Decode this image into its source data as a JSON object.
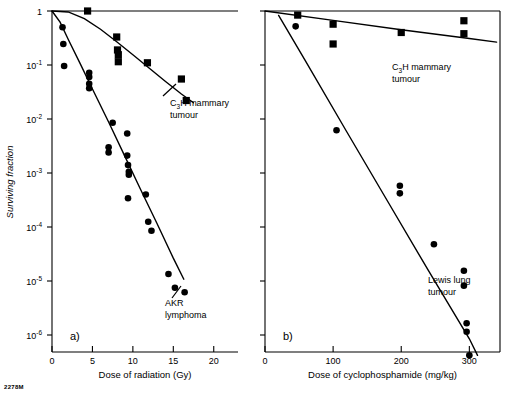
{
  "figure": {
    "mark": "2278M",
    "ylabel": "Surviving fraction",
    "y_ticks": [
      {
        "label": "1",
        "exp": "",
        "value": 0
      },
      {
        "label": "10",
        "exp": "-1",
        "value": -1
      },
      {
        "label": "10",
        "exp": "-2",
        "value": -2
      },
      {
        "label": "10",
        "exp": "-3",
        "value": -3
      },
      {
        "label": "10",
        "exp": "-4",
        "value": -4
      },
      {
        "label": "10",
        "exp": "-5",
        "value": -5
      },
      {
        "label": "10",
        "exp": "-6",
        "value": -6
      }
    ]
  },
  "panel_a": {
    "id": "a)",
    "xlabel": "Dose of radiation (Gy)",
    "x_ticks": [
      "0",
      "5",
      "10",
      "15",
      "20"
    ],
    "annotations": [
      {
        "name": "c3h-mammary-tumour",
        "line1": "C",
        "sub": "3",
        "line1b": "H mammary",
        "line2": "tumour"
      },
      {
        "name": "akr-lymphoma",
        "line1": "AKR",
        "line2": "lymphoma"
      }
    ]
  },
  "panel_b": {
    "id": "b)",
    "xlabel": "Dose of cyclophosphamide (mg/kg)",
    "x_ticks": [
      "0",
      "100",
      "200",
      "300"
    ],
    "annotations": [
      {
        "name": "c3h-mammary-tumour",
        "line1": "C",
        "sub": "3",
        "line1b": "H mammary",
        "line2": "tumour"
      },
      {
        "name": "lewis-lung-tumour",
        "line1": "Lewis lung",
        "line2": "tumour"
      }
    ]
  },
  "chart_data": {
    "type": "scatter",
    "title": "",
    "panels": [
      {
        "id": "a",
        "xlabel": "Dose of radiation (Gy)",
        "ylabel": "Surviving fraction",
        "xlim": [
          0,
          23
        ],
        "ylim_log10": [
          -6.4,
          0.1
        ],
        "xticks": [
          0,
          5,
          10,
          15,
          20
        ],
        "yticks_log10": [
          0,
          -1,
          -2,
          -3,
          -4,
          -5,
          -6
        ],
        "grid": false,
        "legend": "none",
        "series": [
          {
            "name": "C3H mammary tumour",
            "marker": "square",
            "points": [
              {
                "x": 4.4,
                "y": 1.0
              },
              {
                "x": 8.0,
                "y": 0.33
              },
              {
                "x": 8.1,
                "y": 0.19
              },
              {
                "x": 8.2,
                "y": 0.155
              },
              {
                "x": 8.2,
                "y": 0.115
              },
              {
                "x": 11.8,
                "y": 0.11
              },
              {
                "x": 16.0,
                "y": 0.055
              },
              {
                "x": 16.6,
                "y": 0.022
              }
            ],
            "fit_curve": [
              {
                "x": 0.0,
                "y": 1.0
              },
              {
                "x": 2.0,
                "y": 0.96
              },
              {
                "x": 4.0,
                "y": 0.72
              },
              {
                "x": 6.0,
                "y": 0.46
              },
              {
                "x": 8.0,
                "y": 0.27
              },
              {
                "x": 10.0,
                "y": 0.155
              },
              {
                "x": 12.0,
                "y": 0.088
              },
              {
                "x": 14.0,
                "y": 0.05
              },
              {
                "x": 16.0,
                "y": 0.029
              },
              {
                "x": 17.5,
                "y": 0.02
              }
            ]
          },
          {
            "name": "AKR lymphoma",
            "marker": "circle",
            "points": [
              {
                "x": 1.3,
                "y": 0.5
              },
              {
                "x": 1.4,
                "y": 0.245
              },
              {
                "x": 1.5,
                "y": 0.096
              },
              {
                "x": 4.6,
                "y": 0.072
              },
              {
                "x": 4.6,
                "y": 0.06
              },
              {
                "x": 4.6,
                "y": 0.045
              },
              {
                "x": 4.6,
                "y": 0.037
              },
              {
                "x": 7.5,
                "y": 0.0085
              },
              {
                "x": 7.0,
                "y": 0.003
              },
              {
                "x": 7.0,
                "y": 0.0024
              },
              {
                "x": 9.3,
                "y": 0.0054
              },
              {
                "x": 9.3,
                "y": 0.0021
              },
              {
                "x": 9.4,
                "y": 0.0014
              },
              {
                "x": 9.5,
                "y": 0.00105
              },
              {
                "x": 9.5,
                "y": 0.00093
              },
              {
                "x": 9.4,
                "y": 0.00034
              },
              {
                "x": 11.6,
                "y": 0.0004
              },
              {
                "x": 11.9,
                "y": 0.000125
              },
              {
                "x": 12.3,
                "y": 8.5e-05
              },
              {
                "x": 14.4,
                "y": 1.35e-05
              },
              {
                "x": 15.2,
                "y": 7.5e-06
              },
              {
                "x": 16.4,
                "y": 6.2e-06
              }
            ],
            "fit_curve": [
              {
                "x": 0.0,
                "y": 1.0
              },
              {
                "x": 1.0,
                "y": 0.62
              },
              {
                "x": 2.0,
                "y": 0.3
              },
              {
                "x": 3.5,
                "y": 0.105
              },
              {
                "x": 5.0,
                "y": 0.036
              },
              {
                "x": 7.0,
                "y": 0.0088
              },
              {
                "x": 9.0,
                "y": 0.00205
              },
              {
                "x": 11.0,
                "y": 0.00048
              },
              {
                "x": 13.0,
                "y": 0.000115
              },
              {
                "x": 15.0,
                "y": 2.65e-05
              },
              {
                "x": 16.3,
                "y": 1.08e-05
              }
            ]
          }
        ]
      },
      {
        "id": "b",
        "xlabel": "Dose of cyclophosphamide (mg/kg)",
        "ylabel": "Surviving fraction",
        "xlim": [
          0,
          345
        ],
        "ylim_log10": [
          -6.4,
          0.1
        ],
        "xticks": [
          0,
          100,
          200,
          300
        ],
        "yticks_log10": [
          0,
          -1,
          -2,
          -3,
          -4,
          -5,
          -6
        ],
        "grid": false,
        "legend": "none",
        "series": [
          {
            "name": "C3H mammary tumour",
            "marker": "square",
            "points": [
              {
                "x": 48,
                "y": 0.84
              },
              {
                "x": 100,
                "y": 0.57
              },
              {
                "x": 100,
                "y": 0.245
              },
              {
                "x": 200,
                "y": 0.4
              },
              {
                "x": 292,
                "y": 0.66
              },
              {
                "x": 292,
                "y": 0.38
              }
            ],
            "fit_curve": [
              {
                "x": 0,
                "y": 1.0
              },
              {
                "x": 100,
                "y": 0.67
              },
              {
                "x": 200,
                "y": 0.45
              },
              {
                "x": 300,
                "y": 0.31
              },
              {
                "x": 340,
                "y": 0.265
              }
            ]
          },
          {
            "name": "Lewis lung tumour",
            "marker": "circle",
            "points": [
              {
                "x": 45,
                "y": 0.52
              },
              {
                "x": 105,
                "y": 0.0062
              },
              {
                "x": 198,
                "y": 0.00058
              },
              {
                "x": 198,
                "y": 0.00042
              },
              {
                "x": 248,
                "y": 4.8e-05
              },
              {
                "x": 292,
                "y": 1.55e-05
              },
              {
                "x": 292,
                "y": 8.2e-06
              },
              {
                "x": 296,
                "y": 1.65e-06
              },
              {
                "x": 296,
                "y": 1.15e-06
              },
              {
                "x": 300,
                "y": 4.2e-07
              }
            ],
            "fit_curve": [
              {
                "x": 20,
                "y": 0.83
              },
              {
                "x": 60,
                "y": 0.115
              },
              {
                "x": 120,
                "y": 0.0058
              },
              {
                "x": 180,
                "y": 0.0003
              },
              {
                "x": 240,
                "y": 1.55e-05
              },
              {
                "x": 300,
                "y": 8.5e-07
              },
              {
                "x": 312,
                "y": 4.2e-07
              }
            ]
          }
        ]
      }
    ]
  }
}
